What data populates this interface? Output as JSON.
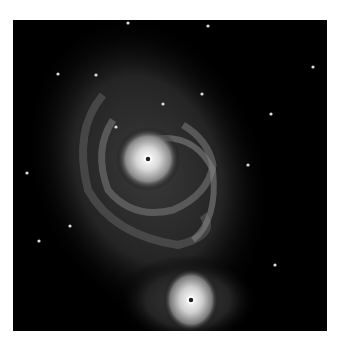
{
  "image": {
    "subject": "spiral galaxy with companion galaxy",
    "background_color": "#000000",
    "page_color": "#ffffff"
  },
  "stars": [
    [
      115,
      3
    ],
    [
      45,
      54
    ],
    [
      83,
      55
    ],
    [
      150,
      84
    ],
    [
      189,
      74
    ],
    [
      258,
      94
    ],
    [
      14,
      153
    ],
    [
      103,
      107
    ],
    [
      235,
      145
    ],
    [
      26,
      221
    ],
    [
      57,
      206
    ],
    [
      262,
      245
    ],
    [
      300,
      47
    ],
    [
      195,
      6
    ]
  ]
}
